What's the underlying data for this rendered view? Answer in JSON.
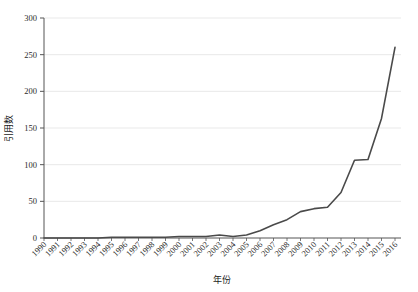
{
  "chart_data": {
    "type": "line",
    "title": "",
    "xlabel": "年份",
    "ylabel": "引用数",
    "x": [
      1990,
      1991,
      1992,
      1993,
      1994,
      1995,
      1996,
      1997,
      1998,
      1999,
      2000,
      2001,
      2002,
      2003,
      2004,
      2005,
      2006,
      2007,
      2008,
      2009,
      2010,
      2011,
      2012,
      2013,
      2014,
      2015,
      2016
    ],
    "categories": [
      "1990",
      "1991",
      "1992",
      "1993",
      "1994",
      "1995",
      "1996",
      "1997",
      "1998",
      "1999",
      "2000",
      "2001",
      "2002",
      "2003",
      "2004",
      "2005",
      "2006",
      "2007",
      "2008",
      "2009",
      "2010",
      "2011",
      "2012",
      "2013",
      "2014",
      "2015",
      "2016"
    ],
    "values": [
      0,
      0,
      0,
      0,
      0,
      1,
      1,
      1,
      1,
      1,
      2,
      2,
      2,
      4,
      2,
      4,
      10,
      18,
      25,
      36,
      40,
      42,
      62,
      106,
      107,
      163,
      260
    ],
    "series": [
      {
        "name": "引用数",
        "values": [
          0,
          0,
          0,
          0,
          0,
          1,
          1,
          1,
          1,
          1,
          2,
          2,
          2,
          4,
          2,
          4,
          10,
          18,
          25,
          36,
          40,
          42,
          62,
          106,
          107,
          163,
          260
        ],
        "color": "#4a4a4a"
      }
    ],
    "xlim": [
      1990,
      2016
    ],
    "ylim": [
      0,
      300
    ],
    "yticks": [
      0,
      50,
      100,
      150,
      200,
      250,
      300
    ],
    "ytick_labels": [
      "0",
      "50",
      "100",
      "150",
      "200",
      "250",
      "300"
    ],
    "grid": "horizontal",
    "grid_color": "#e0e0e0",
    "legend": "none",
    "line_color": "#4a4a4a",
    "line_width": 1.6,
    "axis_color": "#555555",
    "background": "#ffffff",
    "xtick_rotation": 45
  }
}
